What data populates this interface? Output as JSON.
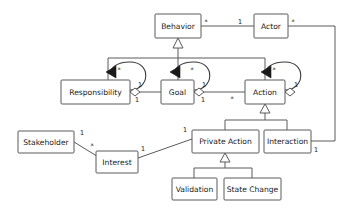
{
  "diagram": {
    "type": "uml-class-diagram",
    "colors": {
      "box_fill": "#ffffff",
      "box_stroke": "#5a5a5a",
      "text": "#1a1a1a",
      "edge": "#5a5a5a",
      "arrow_fill": "#1a1a1a",
      "background": "#ffffff"
    },
    "classes": [
      {
        "id": "behavior",
        "label": "Behavior",
        "x": 155,
        "y": 14,
        "w": 46,
        "h": 24
      },
      {
        "id": "actor",
        "label": "Actor",
        "x": 254,
        "y": 14,
        "w": 34,
        "h": 24
      },
      {
        "id": "responsibility",
        "label": "Responsibility",
        "x": 61,
        "y": 80,
        "w": 69,
        "h": 24
      },
      {
        "id": "goal",
        "label": "Goal",
        "x": 161,
        "y": 80,
        "w": 33,
        "h": 24
      },
      {
        "id": "action",
        "label": "Action",
        "x": 245,
        "y": 80,
        "w": 40,
        "h": 24
      },
      {
        "id": "stakeholder",
        "label": "Stakeholder",
        "x": 18,
        "y": 131,
        "w": 56,
        "h": 22
      },
      {
        "id": "interest",
        "label": "Interest",
        "x": 96,
        "y": 151,
        "w": 42,
        "h": 22
      },
      {
        "id": "private_action",
        "label": "Private Action",
        "x": 192,
        "y": 130,
        "w": 67,
        "h": 23
      },
      {
        "id": "interaction",
        "label": "Interaction",
        "x": 264,
        "y": 130,
        "w": 47,
        "h": 23
      },
      {
        "id": "validation",
        "label": "Validation",
        "x": 172,
        "y": 178,
        "w": 45,
        "h": 22
      },
      {
        "id": "state_change",
        "label": "State Change",
        "x": 224,
        "y": 178,
        "w": 57,
        "h": 22
      }
    ],
    "multiplicities": [
      {
        "id": "m-behavior-right",
        "text": "*",
        "x": 206,
        "y": 22
      },
      {
        "id": "m-actor-left",
        "text": "1",
        "x": 240,
        "y": 22
      },
      {
        "id": "m-actor-right",
        "text": "*",
        "x": 293,
        "y": 22
      },
      {
        "id": "m-resp-loop",
        "text": "*",
        "x": 119,
        "y": 70
      },
      {
        "id": "m-resp-diamond-top",
        "text": "1",
        "x": 140,
        "y": 85
      },
      {
        "id": "m-resp-diamond-bot",
        "text": "1",
        "x": 137,
        "y": 100
      },
      {
        "id": "m-goal-loop",
        "text": "*",
        "x": 192,
        "y": 70
      },
      {
        "id": "m-goal-diamond-top",
        "text": "1",
        "x": 204,
        "y": 85
      },
      {
        "id": "m-goal-diamond-bot",
        "text": "1",
        "x": 203,
        "y": 100
      },
      {
        "id": "m-action-loop",
        "text": "*",
        "x": 274,
        "y": 70
      },
      {
        "id": "m-action-diamond",
        "text": "1",
        "x": 296,
        "y": 85
      },
      {
        "id": "m-action-bottom",
        "text": "*",
        "x": 232,
        "y": 99
      },
      {
        "id": "m-stakeholder",
        "text": "1",
        "x": 82,
        "y": 133
      },
      {
        "id": "m-interest-star",
        "text": "*",
        "x": 92,
        "y": 146
      },
      {
        "id": "m-interest-right",
        "text": "1",
        "x": 143,
        "y": 149
      },
      {
        "id": "m-private-left",
        "text": "1",
        "x": 185,
        "y": 130
      },
      {
        "id": "m-interaction-right",
        "text": "1",
        "x": 316,
        "y": 150
      }
    ],
    "relations": [
      {
        "id": "behavior-actor",
        "kind": "association",
        "from": "behavior",
        "to": "actor"
      },
      {
        "id": "behavior-generalization",
        "kind": "generalization",
        "from": [
          "responsibility",
          "goal",
          "action"
        ],
        "to": "behavior"
      },
      {
        "id": "responsibility-self",
        "kind": "aggregation-self",
        "on": "responsibility"
      },
      {
        "id": "goal-self",
        "kind": "aggregation-self",
        "on": "goal"
      },
      {
        "id": "action-self",
        "kind": "aggregation-self",
        "on": "action"
      },
      {
        "id": "responsibility-goal",
        "kind": "aggregation",
        "from": "goal",
        "to": "responsibility"
      },
      {
        "id": "goal-action",
        "kind": "aggregation",
        "from": "action",
        "to": "goal"
      },
      {
        "id": "action-generalization",
        "kind": "generalization",
        "from": [
          "private_action",
          "interaction"
        ],
        "to": "action"
      },
      {
        "id": "private-generalization",
        "kind": "generalization",
        "from": [
          "validation",
          "state_change"
        ],
        "to": "private_action"
      },
      {
        "id": "stakeholder-interest",
        "kind": "association",
        "from": "stakeholder",
        "to": "interest"
      },
      {
        "id": "interest-private",
        "kind": "association",
        "from": "interest",
        "to": "private_action"
      },
      {
        "id": "actor-interaction",
        "kind": "association",
        "from": "actor",
        "to": "interaction"
      }
    ]
  }
}
